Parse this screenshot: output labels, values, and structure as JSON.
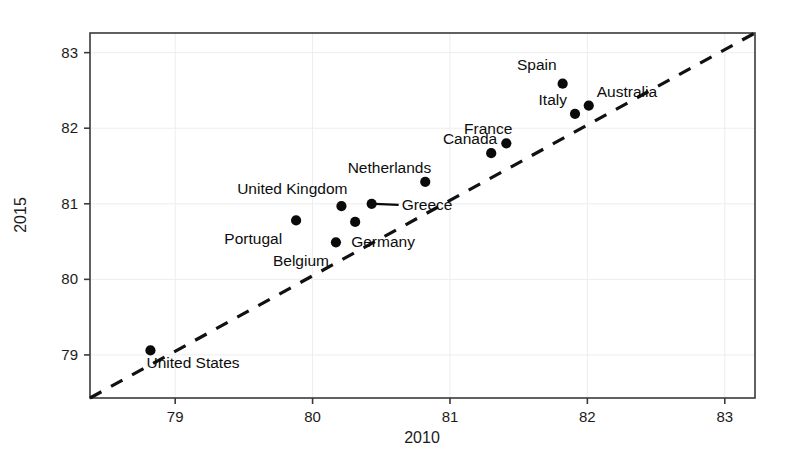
{
  "chart_data": {
    "type": "scatter",
    "title": "",
    "xlabel": "2010",
    "ylabel": "2015",
    "xlim": [
      78.38,
      83.22
    ],
    "ylim": [
      78.43,
      83.26
    ],
    "xticks": [
      79,
      80,
      81,
      82,
      83
    ],
    "yticks": [
      79,
      80,
      81,
      82,
      83
    ],
    "xtick_labels": [
      "79",
      "80",
      "81",
      "82",
      "83"
    ],
    "ytick_labels": [
      "79",
      "80",
      "81",
      "82",
      "83"
    ],
    "grid": true,
    "legend": "none",
    "annotations": [
      {
        "name": "identity-line",
        "kind": "reference-line",
        "description": "45-degree dashed diagonal line y = x",
        "style": "dashed",
        "from": [
          78.38,
          78.43
        ],
        "to": [
          83.22,
          83.26
        ]
      }
    ],
    "points": [
      {
        "label": "United States",
        "x": 78.82,
        "y": 79.06,
        "label_dx": -4,
        "label_dy": 18,
        "label_anchor": "start",
        "leader": false
      },
      {
        "label": "Portugal",
        "x": 79.88,
        "y": 80.78,
        "label_dx": -14,
        "label_dy": 24,
        "label_anchor": "end",
        "leader": false
      },
      {
        "label": "Belgium",
        "x": 80.17,
        "y": 80.49,
        "label_dx": -7,
        "label_dy": 24,
        "label_anchor": "end",
        "leader": false
      },
      {
        "label": "United Kingdom",
        "x": 80.21,
        "y": 80.97,
        "label_dx": 6,
        "label_dy": -12,
        "label_anchor": "end",
        "leader": false
      },
      {
        "label": "Germany",
        "x": 80.31,
        "y": 80.76,
        "label_dx": -4,
        "label_dy": 25,
        "label_anchor": "start",
        "leader": false
      },
      {
        "label": "Greece",
        "x": 80.43,
        "y": 81.0,
        "label_dx": 30,
        "label_dy": 6,
        "label_anchor": "start",
        "leader": true
      },
      {
        "label": "Netherlands",
        "x": 80.82,
        "y": 81.29,
        "label_dx": 6,
        "label_dy": -9,
        "label_anchor": "end",
        "leader": false
      },
      {
        "label": "Canada",
        "x": 81.3,
        "y": 81.67,
        "label_dx": 6,
        "label_dy": -9,
        "label_anchor": "end",
        "leader": false
      },
      {
        "label": "France",
        "x": 81.41,
        "y": 81.8,
        "label_dx": 6,
        "label_dy": -9,
        "label_anchor": "end",
        "leader": false
      },
      {
        "label": "Italy",
        "x": 81.91,
        "y": 82.19,
        "label_dx": -8,
        "label_dy": -9,
        "label_anchor": "end",
        "leader": false
      },
      {
        "label": "Australia",
        "x": 82.01,
        "y": 82.3,
        "label_dx": 8,
        "label_dy": -9,
        "label_anchor": "start",
        "leader": false
      },
      {
        "label": "Spain",
        "x": 81.82,
        "y": 82.59,
        "label_dx": -6,
        "label_dy": -14,
        "label_anchor": "end",
        "leader": false
      }
    ]
  },
  "axes": {
    "x_title": "2010",
    "y_title": "2015"
  },
  "colors": {
    "point": "#0a0a0a",
    "frame": "#3a3a3a",
    "grid": "#ededed",
    "dashed_line": "#111111",
    "background": "#ffffff",
    "text": "#1b1b1b"
  }
}
